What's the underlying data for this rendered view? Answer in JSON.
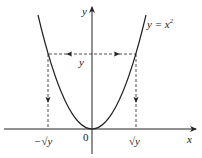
{
  "diagram": {
    "function_label": "y = x",
    "function_exponent": "2",
    "x_axis_label": "x",
    "y_axis_label": "y",
    "level_label": "y",
    "origin_label": "0",
    "neg_root_label": "−√y",
    "pos_root_label": "√y",
    "colors": {
      "stroke": "#222222",
      "background": "#ffffff"
    }
  }
}
